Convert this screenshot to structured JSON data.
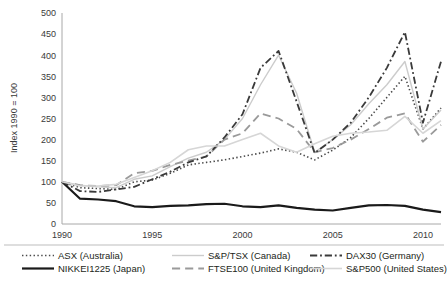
{
  "chart_data": {
    "type": "line",
    "title": "",
    "xlabel": "",
    "ylabel": "Index 1990 = 100",
    "ylim": [
      0,
      500
    ],
    "xlim": [
      1990,
      2011
    ],
    "grid": false,
    "legend_position": "bottom",
    "yticks": [
      0,
      50,
      100,
      150,
      200,
      250,
      300,
      350,
      400,
      450,
      500
    ],
    "xticks": [
      1990,
      1995,
      2000,
      2005,
      2010
    ],
    "x": [
      1990,
      1991,
      1992,
      1993,
      1994,
      1995,
      1996,
      1997,
      1998,
      1999,
      2000,
      2001,
      2002,
      2003,
      2004,
      2005,
      2006,
      2007,
      2008,
      2009,
      2010,
      2011
    ],
    "series": [
      {
        "name": "ASX (Australia)",
        "label": "ASX (Australia)",
        "style": "dotted",
        "color": "#4a4a4a",
        "width": 1.6,
        "values": [
          100,
          86,
          84,
          82,
          100,
          104,
          120,
          140,
          146,
          152,
          160,
          168,
          178,
          170,
          152,
          175,
          205,
          250,
          300,
          350,
          225,
          275
        ]
      },
      {
        "name": "NIKKEI1225 (Japan)",
        "label": "NIKKEI1225 (Japan)",
        "style": "solid",
        "color": "#1a1a1a",
        "width": 2.2,
        "values": [
          100,
          60,
          58,
          54,
          42,
          40,
          43,
          44,
          47,
          48,
          42,
          40,
          44,
          38,
          34,
          32,
          38,
          44,
          45,
          43,
          34,
          28
        ]
      },
      {
        "name": "S&P/TSX (Canada)",
        "label": "S&P/TSX (Canada)",
        "style": "solid",
        "color": "#cccccc",
        "width": 1.4,
        "values": [
          100,
          92,
          88,
          86,
          106,
          114,
          136,
          156,
          170,
          200,
          250,
          330,
          400,
          310,
          170,
          200,
          235,
          285,
          330,
          385,
          225,
          270
        ]
      },
      {
        "name": "FTSE100 (United Kingdom)",
        "label": "FTSE100 (United Kingdom)",
        "style": "dashed",
        "color": "#9a9a9a",
        "width": 1.8,
        "values": [
          100,
          92,
          90,
          92,
          120,
          126,
          140,
          150,
          160,
          200,
          215,
          262,
          250,
          225,
          170,
          180,
          200,
          225,
          252,
          262,
          195,
          235
        ]
      },
      {
        "name": "DAX30 (Germany)",
        "label": "DAX30 (Germany)",
        "style": "dashdot",
        "color": "#3a3a3a",
        "width": 1.8,
        "values": [
          100,
          78,
          76,
          82,
          88,
          106,
          124,
          146,
          160,
          205,
          260,
          370,
          410,
          290,
          168,
          200,
          240,
          300,
          370,
          455,
          240,
          385
        ]
      },
      {
        "name": "S&P500 (United States)",
        "label": "S&P500 (United States)",
        "style": "solid",
        "color": "#d6d6d6",
        "width": 1.6,
        "values": [
          100,
          90,
          90,
          94,
          110,
          126,
          146,
          176,
          185,
          185,
          200,
          215,
          185,
          170,
          190,
          208,
          215,
          218,
          222,
          255,
          215,
          245
        ]
      }
    ]
  }
}
